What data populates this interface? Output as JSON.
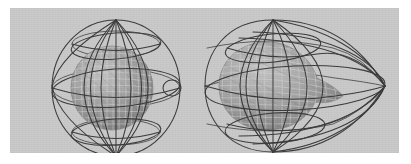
{
  "figure": {
    "title": "",
    "background_color": "#ffffff",
    "panel_color": "#c9c9c9",
    "panel_rect": {
      "x": 10,
      "y": 8,
      "width": 389,
      "height": 145
    },
    "wireframe_color": "#3a3a3a",
    "mesh_line_color": "#d8d8d8",
    "inner_surface_color": "#9a9a9a",
    "panels": [
      {
        "id": "left",
        "label": "sphere-with-inner-sphere",
        "outer_shape": "sphere",
        "outer_wireframe": {
          "type": "latitude-longitude-grid",
          "meridians": 8,
          "parallels": 4,
          "center": {
            "x": 98,
            "y": 80
          },
          "radius_x": 64,
          "radius_y": 68
        },
        "inner_shape": "sphere",
        "inner_surface": {
          "type": "triangulated-mesh-sphere",
          "center": {
            "x": 94,
            "y": 80
          },
          "radius_x": 41,
          "radius_y": 42,
          "mesh_rows": 13,
          "mesh_cols": 14
        }
      },
      {
        "id": "right",
        "label": "deformed-shape-with-inner-blob",
        "outer_shape": "teardrop",
        "outer_wireframe": {
          "type": "latitude-longitude-grid-deformed",
          "meridians": 8,
          "parallels": 4,
          "center": {
            "x": 78,
            "y": 80
          },
          "radius_x": 68,
          "radius_y": 68,
          "tip": {
            "x": 190,
            "y": 78
          }
        },
        "inner_shape": "teardrop",
        "inner_surface": {
          "type": "triangulated-mesh-blob",
          "center": {
            "x": 72,
            "y": 78
          },
          "radius_x": 48,
          "radius_y": 43,
          "tip": {
            "x": 148,
            "y": 88
          },
          "mesh_rows": 12,
          "mesh_cols": 14
        }
      }
    ]
  }
}
